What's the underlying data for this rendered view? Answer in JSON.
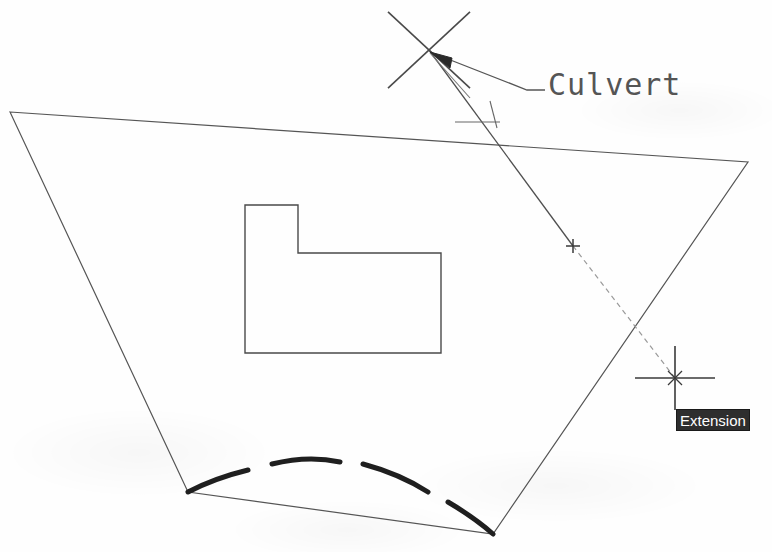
{
  "canvas": {
    "width": 772,
    "height": 552,
    "background_color": "#fefefe",
    "line_color": "#555555",
    "heavy_line_color": "#1f1f1f"
  },
  "annotation": {
    "culvert_label": "Culvert",
    "leader_arrow": "arrow-head"
  },
  "snap_tooltip": {
    "text": "Extension",
    "background_color": "#2e2e2e",
    "text_color": "#ffffff"
  },
  "geometry": {
    "parcel_boundary": {
      "name": "parcel-quadrilateral",
      "points": "10,112 748,162 493,534 188,492",
      "stroke_width": 1.2
    },
    "building_footprint": {
      "name": "l-shaped-building",
      "points": "245,205 298,205 298,253 441,253 441,353 245,353",
      "stroke_width": 1.4
    },
    "culvert_line_solid": {
      "name": "culvert-centerline",
      "x1": 429,
      "y1": 50,
      "x2": 573,
      "y2": 246,
      "stroke_width": 1.3
    },
    "culvert_line_extension": {
      "name": "extension-dashed-line",
      "x1": 573,
      "y1": 246,
      "x2": 675,
      "y2": 378,
      "stroke_width": 1.2,
      "dash": "5 4"
    },
    "osnap_x_marker": {
      "name": "osnap-intersection-marker",
      "cx": 429,
      "cy": 50,
      "arm": 41
    },
    "plus_marker": {
      "name": "extension-plus-marker",
      "cx": 573,
      "cy": 246,
      "arm": 7
    },
    "crosshair_cursor": {
      "name": "crosshair-cursor",
      "cx": 675,
      "cy": 378,
      "arm_h": 40,
      "arm_v": 32
    },
    "perpendicular_ticks": {
      "name": "perpendicular-snap-ticks",
      "tick_h": "455,122 500,122",
      "tick_v": "490,101 497,128"
    },
    "leader": {
      "name": "culvert-leader-line",
      "points": "430,52 527,90 545,90",
      "arrow": "430,52 452,58 450,68"
    },
    "leader_secondary": {
      "name": "culvert-leader-secondary",
      "points": "430,53 470,98"
    },
    "arc_segments": {
      "name": "dashed-heavy-arc",
      "stroke_width": 5,
      "paths": [
        "M188,492 Q215,478 248,470",
        "M272,464 Q308,455 340,462",
        "M363,464 Q400,474 428,492",
        "M448,502 Q475,518 493,534"
      ]
    }
  }
}
